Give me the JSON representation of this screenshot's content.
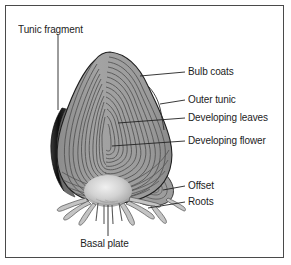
{
  "figure": {
    "type": "labeled-botanical-diagram",
    "width": 291,
    "height": 265,
    "border_color": "#4a4a4a",
    "background_color": "#ffffff"
  },
  "colors": {
    "bulb_fill": "#9d9d9d",
    "bulb_fill_light": "#b2b2b2",
    "bulb_outline": "#2a2a2a",
    "scale_line": "#545454",
    "tunic_fragment": "#141414",
    "basal_plate": "#d5d5d5",
    "root_fill": "#c2c2c2",
    "leader_line": "#2b2b2b",
    "text": "#1c1c1c"
  },
  "labels": {
    "tunic_fragment": "Tunic fragment",
    "bulb_coats": "Bulb coats",
    "outer_tunic": "Outer tunic",
    "developing_leaves": "Developing leaves",
    "developing_flower": "Developing flower",
    "offset": "Offset",
    "roots": "Roots",
    "basal_plate": "Basal plate"
  },
  "callouts": [
    {
      "id": "tunic-fragment",
      "label": "Tunic fragment",
      "position": "top-left",
      "leader": "vertical line descending from text to the dark crescent on the left side of the bulb"
    },
    {
      "id": "bulb-coats",
      "label": "Bulb coats",
      "position": "right",
      "leader": "horizontal line from text left to the upper outer scale layers"
    },
    {
      "id": "outer-tunic",
      "label": "Outer tunic",
      "position": "right",
      "leader": "horizontal line from text left to the bulb's outer skin edge"
    },
    {
      "id": "developing-leaves",
      "label": "Developing leaves",
      "position": "right",
      "leader": "horizontal line from text left into the mid concentric layers"
    },
    {
      "id": "developing-flower",
      "label": "Developing flower",
      "position": "right",
      "leader": "horizontal line from text left into the innermost core"
    },
    {
      "id": "offset",
      "label": "Offset",
      "position": "lower-right",
      "leader": "horizontal line from text left to the small daughter bulb"
    },
    {
      "id": "roots",
      "label": "Roots",
      "position": "lower-right",
      "leader": "horizontal line from text left to the root strands"
    },
    {
      "id": "basal-plate",
      "label": "Basal plate",
      "position": "bottom-center",
      "leader": "vertical line rising from text to the pale dome at the bulb base"
    }
  ]
}
